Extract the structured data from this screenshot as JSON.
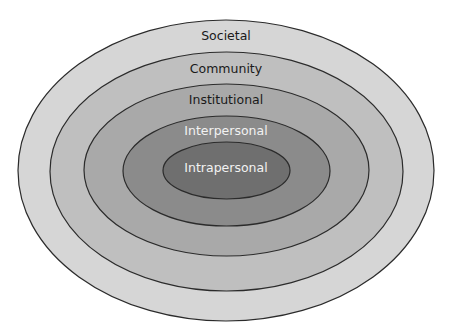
{
  "diagram": {
    "type": "nested-ellipses",
    "layers": [
      {
        "label": "Societal",
        "cx": 226,
        "cy": 170.5,
        "rx": 208,
        "ry": 150.5,
        "fill": "#d6d6d6",
        "text_color": "#1a1a1a",
        "label_y": 35
      },
      {
        "label": "Community",
        "cx": 226.5,
        "cy": 171.5,
        "rx": 176.5,
        "ry": 119.5,
        "fill": "#bfbfbf",
        "text_color": "#1a1a1a",
        "label_y": 68
      },
      {
        "label": "Institutional",
        "cx": 226.5,
        "cy": 170,
        "rx": 142.5,
        "ry": 86,
        "fill": "#a9a9a9",
        "text_color": "#1a1a1a",
        "label_y": 99
      },
      {
        "label": "Interpersonal",
        "cx": 226.5,
        "cy": 171,
        "rx": 103.5,
        "ry": 55,
        "fill": "#8b8b8b",
        "text_color": "#f2f2f2",
        "label_y": 130
      },
      {
        "label": "Intrapersonal",
        "cx": 226.5,
        "cy": 170.5,
        "rx": 63.5,
        "ry": 28.5,
        "fill": "#6f6f6f",
        "text_color": "#f2f2f2",
        "label_y": 167
      }
    ],
    "stroke_color": "#2b2b2b"
  }
}
